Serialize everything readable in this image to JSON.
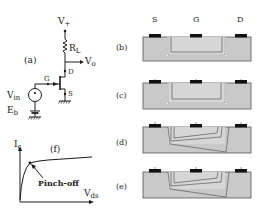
{
  "circuit": {
    "panel_label": "(a)",
    "supply_label": "V",
    "supply_sub": "+",
    "load_label": "R",
    "load_sub": "L",
    "output_label": "V",
    "output_sub": "o",
    "drain_label": "D",
    "gate_label": "G",
    "source_label": "S",
    "input_label": "V",
    "input_sub": "in",
    "bias_label": "E",
    "bias_sub": "b"
  },
  "iv_curve": {
    "panel_label": "(f)",
    "y_axis_label": "I",
    "y_axis_sub": "c",
    "x_axis_label": "V",
    "x_axis_sub": "ds",
    "annotation": "Pinch-off"
  },
  "cross_sections": {
    "terminal_labels": [
      "S",
      "G",
      "D"
    ],
    "panels": [
      {
        "label": "(b)",
        "channel": "uniform"
      },
      {
        "label": "(c)",
        "channel": "uniform"
      },
      {
        "label": "(d)",
        "channel": "tapered"
      },
      {
        "label": "(e)",
        "channel": "tapered"
      }
    ],
    "colors": {
      "substrate": "#c9c9c9",
      "channel": "#d6d6d6",
      "contact": "#111111",
      "outline": "#555555"
    }
  }
}
